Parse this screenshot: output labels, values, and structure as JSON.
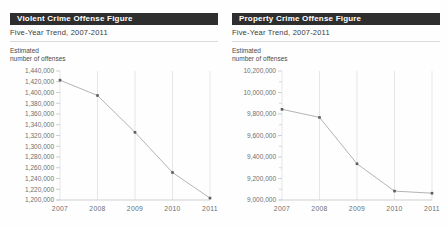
{
  "colors": {
    "header_bg": "#2e2e2e",
    "header_text": "#ffffff",
    "subtitle_text": "#3a3a3a",
    "axis_text": "#6e6e6e",
    "line": "#b4b4b4",
    "marker": "#5c5c5c",
    "grid": "#e6e6e6",
    "axis_line": "#cfcfcf",
    "separator": "#dcdcdc"
  },
  "chart_data": [
    {
      "type": "line",
      "title": "Violent Crime Offense Figure",
      "subtitle": "Five-Year Trend, 2007-2011",
      "ylabel": "Estimated\nnumber of offenses",
      "xlabel": "",
      "categories": [
        "2007",
        "2008",
        "2009",
        "2010",
        "2011"
      ],
      "values": [
        1422970,
        1394461,
        1325896,
        1251248,
        1203564
      ],
      "ylim": [
        1200000,
        1440000
      ],
      "ytick_step": 20000,
      "ytick_minor_step": null,
      "grid": "vertical",
      "legend": "none"
    },
    {
      "type": "line",
      "title": "Property Crime Offense Figure",
      "subtitle": "Five-Year Trend, 2007-2011",
      "ylabel": "Estimated\nnumber of offenses",
      "xlabel": "",
      "categories": [
        "2007",
        "2008",
        "2009",
        "2010",
        "2011"
      ],
      "values": [
        9843481,
        9767915,
        9337060,
        9082887,
        9063173
      ],
      "ylim": [
        9000000,
        10200000
      ],
      "ytick_step": 200000,
      "ytick_minor_step": 100000,
      "grid": "vertical",
      "legend": "none"
    }
  ]
}
